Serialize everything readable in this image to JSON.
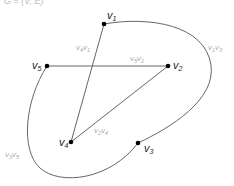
{
  "diagram": {
    "type": "graph",
    "top_cut_text": "G = (V, E)",
    "vertices": [
      {
        "id": "v1",
        "base": "v",
        "sub": "1",
        "x": 104,
        "y": 24,
        "lx": 107,
        "ly": 19
      },
      {
        "id": "v2",
        "base": "v",
        "sub": "2",
        "x": 168,
        "y": 66,
        "lx": 173,
        "ly": 69
      },
      {
        "id": "v3",
        "base": "v",
        "sub": "3",
        "x": 138,
        "y": 143,
        "lx": 144,
        "ly": 152
      },
      {
        "id": "v4",
        "base": "v",
        "sub": "4",
        "x": 71,
        "y": 142,
        "lx": 59,
        "ly": 146
      },
      {
        "id": "v5",
        "base": "v",
        "sub": "5",
        "x": 47,
        "y": 66,
        "lx": 32,
        "ly": 69
      }
    ],
    "edges": [
      {
        "id": "v4v1",
        "base1": "v",
        "sub1": "4",
        "base2": "v",
        "sub2": "1",
        "lx": 76,
        "ly": 50
      },
      {
        "id": "v5v2",
        "base1": "v",
        "sub1": "5",
        "base2": "v",
        "sub2": "2",
        "lx": 130,
        "ly": 61
      },
      {
        "id": "v1v3",
        "base1": "v",
        "sub1": "1",
        "base2": "v",
        "sub2": "3",
        "lx": 208,
        "ly": 50
      },
      {
        "id": "v2v4",
        "base1": "v",
        "sub1": "2",
        "base2": "v",
        "sub2": "4",
        "lx": 94,
        "ly": 133
      },
      {
        "id": "v3v5",
        "base1": "v",
        "sub1": "3",
        "base2": "v",
        "sub2": "5",
        "lx": 5,
        "ly": 157
      }
    ]
  }
}
